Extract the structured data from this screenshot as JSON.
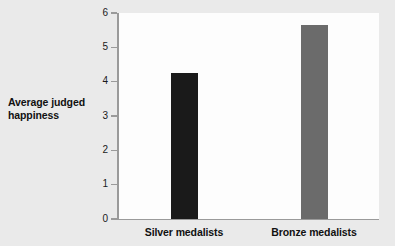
{
  "chart_data": {
    "type": "bar",
    "title": "",
    "subtitle": "",
    "xlabel": "",
    "ylabel": "Average judged happiness",
    "ylabel_line1": "Average judged",
    "ylabel_line2": "happiness",
    "categories": [
      "Silver medalists",
      "Bronze medalists"
    ],
    "values": [
      4.25,
      5.65
    ],
    "ylim": [
      0,
      6
    ],
    "ytick_labels": [
      "0",
      "1",
      "2",
      "3",
      "4",
      "5",
      "6"
    ],
    "ytick_values": [
      0,
      1,
      2,
      3,
      4,
      5,
      6
    ],
    "grid": false,
    "legend": null,
    "bar_colors": [
      "#1a1a1a",
      "#6b6b6b"
    ],
    "annotations": []
  },
  "style": {
    "page_background": "#eaeaea",
    "plot_background": "#fdfdfd",
    "axis_color": "#9a9a9a",
    "text_color": "#111111"
  }
}
